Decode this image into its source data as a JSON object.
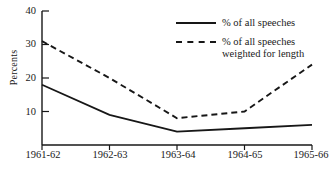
{
  "chart_data": {
    "type": "line",
    "title": "",
    "xlabel": "",
    "ylabel": "Percents",
    "categories": [
      "1961-62",
      "1962-63",
      "1963-64",
      "1964-65",
      "1965-66"
    ],
    "yticks": [
      10,
      20,
      30,
      40
    ],
    "ylim": [
      0,
      40
    ],
    "grid": false,
    "legend_position": "top-right",
    "series": [
      {
        "name": "% of all speeches",
        "style": "solid",
        "color": "#171717",
        "values": [
          18,
          9,
          4,
          5,
          6
        ]
      },
      {
        "name": "% of all speeches\nweighted for length",
        "style": "dashed",
        "color": "#171717",
        "values": [
          31,
          20,
          8,
          10,
          24
        ]
      }
    ]
  },
  "legend": {
    "items": [
      {
        "label": "% of all speeches",
        "style": "solid"
      },
      {
        "label": "% of all speeches\nweighted for length",
        "style": "dashed"
      }
    ]
  },
  "axes": {
    "y_label": "Percents",
    "y_tick_labels": [
      "40",
      "30",
      "20",
      "10"
    ],
    "x_tick_labels": [
      "1961-62",
      "1962-63",
      "1963-64",
      "1964-65",
      "1965-66"
    ]
  }
}
